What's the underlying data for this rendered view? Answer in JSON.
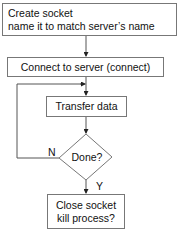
{
  "diagram": {
    "type": "flowchart",
    "nodes": {
      "create": {
        "line1": "Create socket",
        "line2": "name it to match server’s name"
      },
      "connect": {
        "label": "Connect to server (connect)"
      },
      "transfer": {
        "label": "Transfer data"
      },
      "done": {
        "label": "Done?"
      },
      "close": {
        "line1": "Close socket",
        "line2": "kill process?"
      }
    },
    "edge_labels": {
      "no": "N",
      "yes": "Y"
    },
    "edges": [
      {
        "from": "create",
        "to": "connect"
      },
      {
        "from": "connect",
        "to": "transfer"
      },
      {
        "from": "transfer",
        "to": "done"
      },
      {
        "from": "done",
        "to": "transfer",
        "label": "N"
      },
      {
        "from": "done",
        "to": "close",
        "label": "Y"
      }
    ],
    "colors": {
      "stroke": "#777777",
      "text": "#111111",
      "background": "#ffffff"
    }
  }
}
